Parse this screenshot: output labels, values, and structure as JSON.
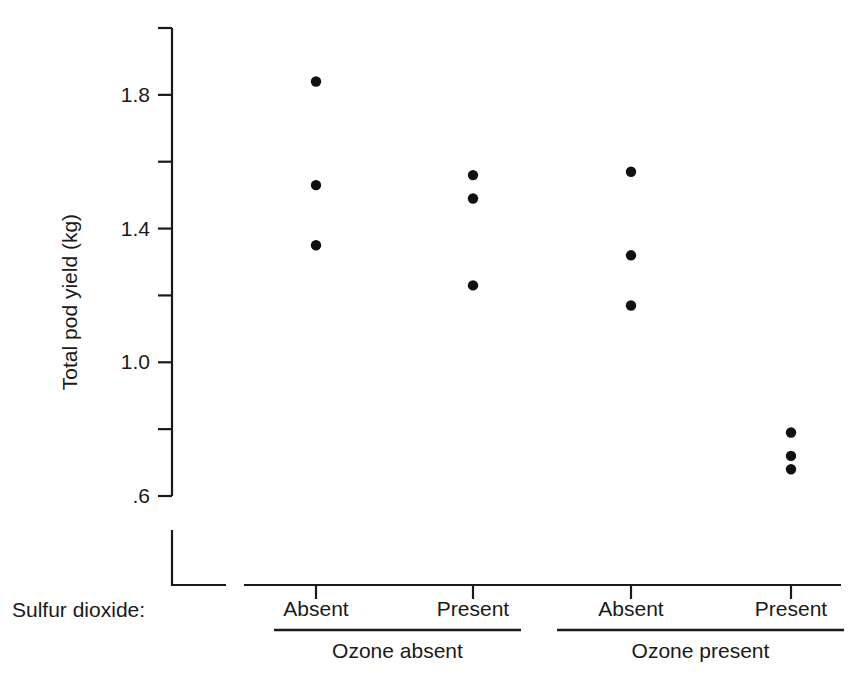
{
  "chart_data": {
    "type": "scatter",
    "title": "",
    "xlabel": "",
    "ylabel": "Total pod yield (kg)",
    "ylim": [
      0.55,
      2.0
    ],
    "grid": false,
    "legend": false,
    "y_ticks": [
      {
        "value": 2.0,
        "label": ""
      },
      {
        "value": 1.8,
        "label": "1.8"
      },
      {
        "value": 1.6,
        "label": ""
      },
      {
        "value": 1.4,
        "label": "1.4"
      },
      {
        "value": 1.2,
        "label": ""
      },
      {
        "value": 1.0,
        "label": "1.0"
      },
      {
        "value": 0.8,
        "label": ""
      },
      {
        "value": 0.6,
        "label": ".6"
      }
    ],
    "x_factor_label": "Sulfur dioxide:",
    "panels": [
      {
        "label": "Ozone absent",
        "groups": [
          {
            "label": "Absent",
            "values": [
              1.84,
              1.53,
              1.35
            ]
          },
          {
            "label": "Present",
            "values": [
              1.56,
              1.49,
              1.23
            ]
          }
        ]
      },
      {
        "label": "Ozone present",
        "groups": [
          {
            "label": "Absent",
            "values": [
              1.57,
              1.32,
              1.17
            ]
          },
          {
            "label": "Present",
            "values": [
              0.79,
              0.72,
              0.68
            ]
          }
        ]
      }
    ],
    "point_color": "#111111"
  }
}
